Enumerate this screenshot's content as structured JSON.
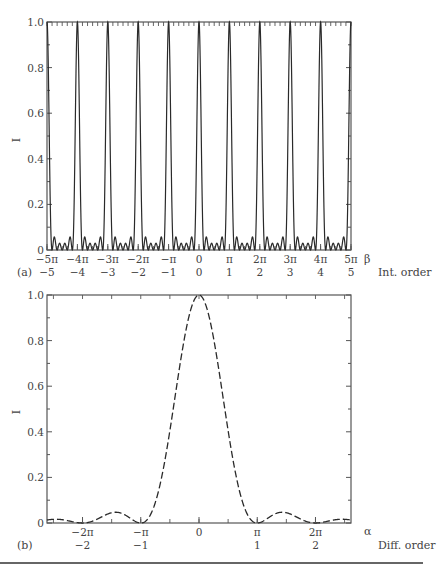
{
  "chart_data": [
    {
      "panel": "(a)",
      "type": "line",
      "description": "Multi-slit interference pattern: sharp principal maxima at integer multiples of pi with small subsidiary maxima between them",
      "ylabel": "I",
      "xlabel": "β",
      "secondary_xlabel": "Int. order",
      "xlim": [
        -15.708,
        15.708
      ],
      "ylim": [
        0,
        1.0
      ],
      "ytick_labels": [
        "0",
        "0.2",
        "0.4",
        "0.6",
        "0.8",
        "1.0"
      ],
      "ytick_values": [
        0,
        0.2,
        0.4,
        0.6,
        0.8,
        1.0
      ],
      "xtick_labels": [
        "−5π",
        "−4π",
        "−3π",
        "−2π",
        "−π",
        "0",
        "π",
        "2π",
        "3π",
        "4π",
        "5π"
      ],
      "secondary_xtick_labels": [
        "−5",
        "−4",
        "−3",
        "−2",
        "−1",
        "0",
        "1",
        "2",
        "3",
        "4",
        "5"
      ],
      "principal_maxima_x": [
        -5,
        -4,
        -3,
        -2,
        -1,
        0,
        1,
        2,
        3,
        4,
        5
      ],
      "principal_maxima_unit": "π",
      "principal_maxima_y": 1.0,
      "num_slits_N": 6,
      "subsidiary_maxima_count_between_principals": 4,
      "subsidiary_maxima_peak_approx": 0.06,
      "line_style": "solid",
      "grid": false
    },
    {
      "panel": "(b)",
      "type": "line",
      "description": "Single-slit diffraction envelope (sinc^2)",
      "ylabel": "I",
      "xlabel": "α",
      "secondary_xlabel": "Diff. order",
      "xlim": [
        -8.2,
        8.2
      ],
      "ylim": [
        0,
        1.0
      ],
      "ytick_labels": [
        "0",
        "0.2",
        "0.4",
        "0.6",
        "0.8",
        "1.0"
      ],
      "ytick_values": [
        0,
        0.2,
        0.4,
        0.6,
        0.8,
        1.0
      ],
      "xtick_labels": [
        "−2π",
        "−π",
        "0",
        "π",
        "2π"
      ],
      "xtick_values_unit_pi": [
        -2,
        -1,
        0,
        1,
        2
      ],
      "secondary_xtick_labels": [
        "−2",
        "−1",
        "1",
        "2"
      ],
      "peak": {
        "x": 0,
        "y": 1.0
      },
      "zeros_x_unit_pi": [
        -2,
        -1,
        1,
        2
      ],
      "side_lobes": [
        {
          "x_unit_pi": -1.43,
          "y": 0.047
        },
        {
          "x_unit_pi": 1.43,
          "y": 0.047
        }
      ],
      "line_style": "dashed",
      "grid": false
    }
  ],
  "figure": {
    "panel_a": {
      "label": "(a)",
      "y_axis_title": "I",
      "x_axis_symbol": "β",
      "order_axis_title": "Int. order",
      "y_ticks": [
        "0",
        "0.2",
        "0.4",
        "0.6",
        "0.8",
        "1.0"
      ],
      "x_ticks": [
        "−5π",
        "−4π",
        "−3π",
        "−2π",
        "−π",
        "0",
        "π",
        "2π",
        "3π",
        "4π",
        "5π"
      ],
      "order_ticks": [
        "−5",
        "−4",
        "−3",
        "−2",
        "−1",
        "0",
        "1",
        "2",
        "3",
        "4",
        "5"
      ]
    },
    "panel_b": {
      "label": "(b)",
      "y_axis_title": "I",
      "x_axis_symbol": "α",
      "order_axis_title": "Diff. order",
      "y_ticks": [
        "0",
        "0.2",
        "0.4",
        "0.6",
        "0.8",
        "1.0"
      ],
      "x_ticks": [
        "−2π",
        "−π",
        "0",
        "π",
        "2π"
      ],
      "order_ticks": [
        "−2",
        "−1",
        "1",
        "2"
      ]
    },
    "colors": {
      "line": "#2a2a2a",
      "axis": "#555555",
      "text": "#444444",
      "rule": "#333333"
    }
  }
}
